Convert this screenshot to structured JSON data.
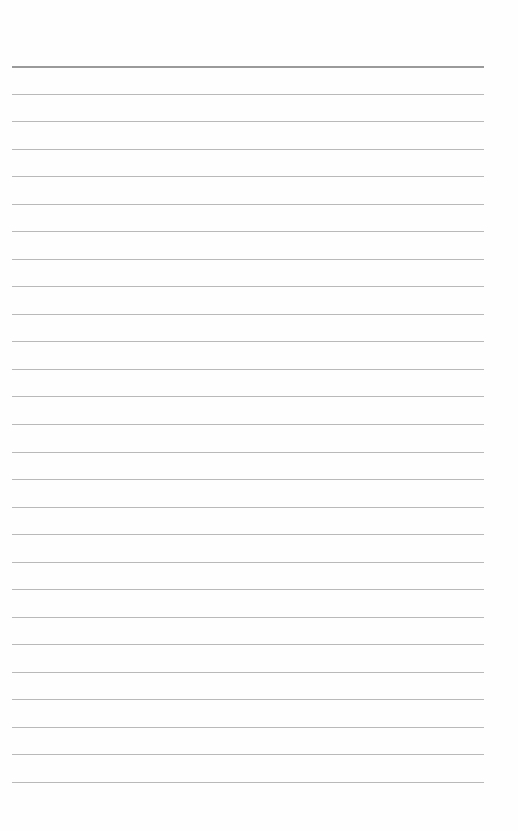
{
  "page": {
    "type": "lined-paper",
    "background": "#fefefe",
    "line_color": "#b9b9b9",
    "top_line_color": "#9a9a9a",
    "line_count": 27,
    "first_line_y": 66,
    "last_line_y": 782,
    "line_left": 12,
    "line_right": 484
  }
}
